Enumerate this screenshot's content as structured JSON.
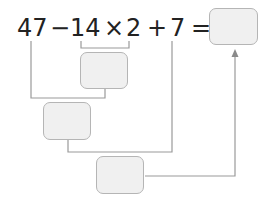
{
  "expression": {
    "tokens": [
      "47",
      "−",
      "14",
      "×",
      "2",
      "+",
      "7",
      "="
    ],
    "full_text": "47 − 14 × 2 + 7 ="
  },
  "answer_boxes": {
    "step1": {
      "label": "14 × 2 result",
      "value": ""
    },
    "step2": {
      "label": "47 − (14 × 2) result",
      "value": ""
    },
    "step3": {
      "label": "+ 7 result",
      "value": ""
    },
    "final": {
      "label": "final answer",
      "value": ""
    }
  },
  "colors": {
    "text": "#222222",
    "line": "#9a9a9a",
    "box_fill": "#f0f0f0",
    "box_border": "#b5b5b5"
  }
}
